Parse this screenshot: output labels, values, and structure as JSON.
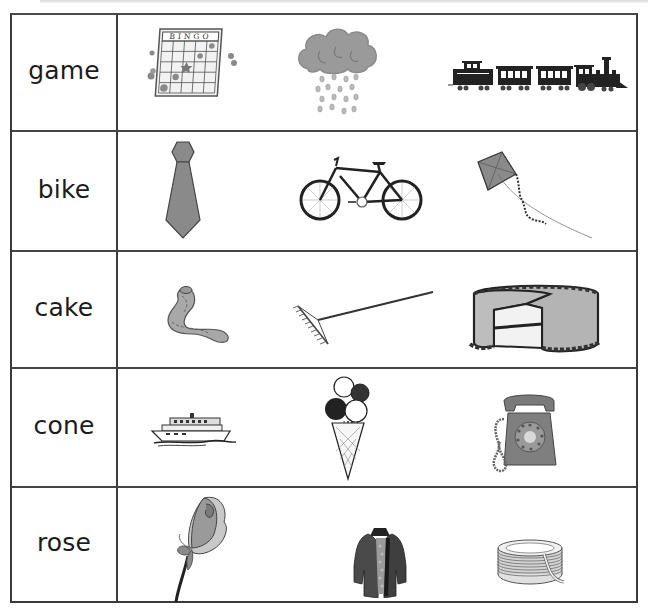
{
  "worksheet": {
    "rows": [
      {
        "word": "game",
        "pictures": [
          {
            "name": "bingo-card",
            "label": "BINGO"
          },
          {
            "name": "rain-cloud"
          },
          {
            "name": "train"
          }
        ]
      },
      {
        "word": "bike",
        "pictures": [
          {
            "name": "necktie"
          },
          {
            "name": "bicycle"
          },
          {
            "name": "kite"
          }
        ]
      },
      {
        "word": "cake",
        "pictures": [
          {
            "name": "snake"
          },
          {
            "name": "rake"
          },
          {
            "name": "cake"
          }
        ]
      },
      {
        "word": "cone",
        "pictures": [
          {
            "name": "boat"
          },
          {
            "name": "ice-cream-cone"
          },
          {
            "name": "telephone"
          }
        ]
      },
      {
        "word": "rose",
        "pictures": [
          {
            "name": "rose"
          },
          {
            "name": "coat"
          },
          {
            "name": "rope"
          }
        ]
      }
    ]
  },
  "colors": {
    "border": "#3a3a3a",
    "text": "#1c1c1c",
    "fill_gray": "#8a8a8a",
    "fill_light": "#c8c8c8"
  }
}
